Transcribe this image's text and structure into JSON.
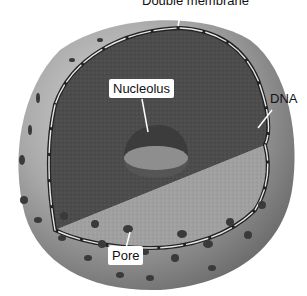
{
  "figure": {
    "labels": {
      "double_membrane": "Double membrane",
      "nucleolus": "Nucleolus",
      "dna": "DNA",
      "pore": "Pore"
    },
    "colors": {
      "envelope_outer": "#9a9a9a",
      "envelope_light": "#c8c8c8",
      "interior_dark": "#4a4a4a",
      "interior_light": "#9d9d9d",
      "pore": "#3a3a3a",
      "label_bg": "#ffffff",
      "label_text": "#111111"
    }
  }
}
